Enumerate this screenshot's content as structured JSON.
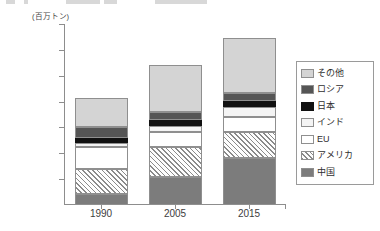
{
  "chart": {
    "unit_label": "(百万トン)",
    "y_axis": {
      "ticks": [
        "35,000",
        "30,000",
        "25,000",
        "20,000",
        "15,000",
        "10,000",
        "5,000",
        "0"
      ],
      "min": 0,
      "max": 35000,
      "step": 5000
    },
    "x_axis": {
      "categories": [
        "1990",
        "2005",
        "2015"
      ]
    }
  },
  "legend": {
    "items": [
      {
        "label": "その他",
        "swatch": "other-swatch",
        "color": "#d4d4d4"
      },
      {
        "label": "ロシア",
        "swatch": "russia-swatch",
        "color": "#555555"
      },
      {
        "label": "日本",
        "swatch": "japan-swatch",
        "color": "#111111"
      },
      {
        "label": "インド",
        "swatch": "india-swatch",
        "color": "#f4f4f4"
      },
      {
        "label": "EU",
        "swatch": "eu-swatch",
        "color": "#ffffff"
      },
      {
        "label": "アメリカ",
        "swatch": "america-swatch",
        "color": "hatch"
      },
      {
        "label": "中国",
        "swatch": "china-swatch",
        "color": "#7c7c7c"
      }
    ]
  },
  "chart_data": {
    "type": "bar",
    "stacked": true,
    "title": "",
    "xlabel": "",
    "ylabel": "(百万トン)",
    "ylim": [
      0,
      35000
    ],
    "yticks": [
      0,
      5000,
      10000,
      15000,
      20000,
      25000,
      30000,
      35000
    ],
    "grid": false,
    "legend_position": "right",
    "categories": [
      "1990",
      "2005",
      "2015"
    ],
    "series": [
      {
        "name": "中国",
        "values": [
          2200,
          5400,
          9100
        ]
      },
      {
        "name": "アメリカ",
        "values": [
          4800,
          5900,
          5100
        ]
      },
      {
        "name": "EU",
        "values": [
          4300,
          2900,
          2800
        ]
      },
      {
        "name": "インド",
        "values": [
          600,
          1000,
          2000
        ]
      },
      {
        "name": "日本",
        "values": [
          1000,
          1200,
          1200
        ]
      },
      {
        "name": "ロシア",
        "values": [
          2200,
          1600,
          1500
        ]
      },
      {
        "name": "その他",
        "values": [
          5600,
          9000,
          10500
        ]
      }
    ],
    "totals": [
      20700,
      27000,
      32200
    ]
  }
}
